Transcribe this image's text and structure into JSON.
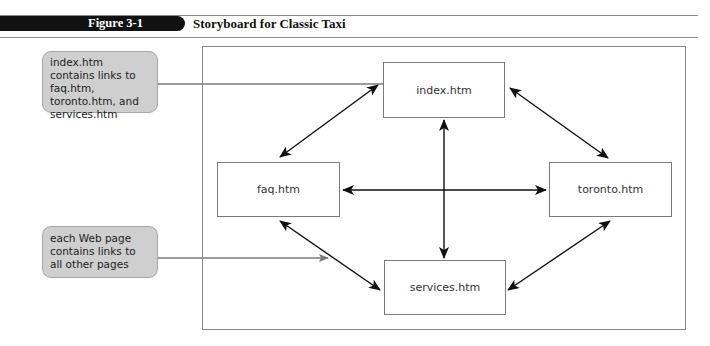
{
  "figure": {
    "label": "Figure 3-1",
    "title": "Storyboard for Classic Taxi"
  },
  "pages": {
    "index": "index.htm",
    "faq": "faq.htm",
    "toronto": "toronto.htm",
    "services": "services.htm"
  },
  "callouts": [
    {
      "text": "index.htm contains links to faq.htm, toronto.htm, and services.htm",
      "points_to": "index.htm"
    },
    {
      "text": "each Web page contains links to all other pages",
      "points_to": "links between pages"
    }
  ],
  "links": [
    [
      "index.htm",
      "faq.htm"
    ],
    [
      "index.htm",
      "toronto.htm"
    ],
    [
      "index.htm",
      "services.htm"
    ],
    [
      "faq.htm",
      "toronto.htm"
    ],
    [
      "faq.htm",
      "services.htm"
    ],
    [
      "toronto.htm",
      "services.htm"
    ]
  ],
  "colors": {
    "header_bar": "#111111",
    "callout_fill": "#cfcfcf",
    "arrow": "#111111",
    "pointer": "#7a7a7a"
  }
}
